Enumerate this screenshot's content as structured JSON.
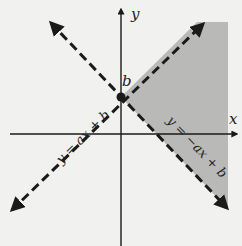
{
  "diagram": {
    "type": "coordinate-plane-inequality",
    "axes": {
      "x_label": "x",
      "y_label": "y"
    },
    "intercept_label": "b",
    "lines": [
      {
        "label": "y = ax + b",
        "style": "dashed"
      },
      {
        "label": "y = −ax + b",
        "style": "dashed"
      }
    ],
    "shaded_region": {
      "description": "region right of y-axis, above y = -ax + b and below y = ax + b",
      "color": "#b9b9b7"
    },
    "colors": {
      "background": "#f1f1f0",
      "ink": "#1a1a1a",
      "shade": "#b9b9b7"
    }
  }
}
